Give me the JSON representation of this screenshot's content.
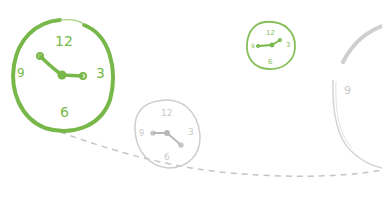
{
  "illustration": {
    "subject": "clocks-along-dashed-path",
    "colors": {
      "primary_green": "#78b84a",
      "gray": "#c8c8c8",
      "dash_gray": "#c4c4c4",
      "background": "#ffffff"
    },
    "clocks": [
      {
        "name": "large-green-clock",
        "numerals": {
          "n12": "12",
          "n3": "3",
          "n6": "6",
          "n9": "9"
        }
      },
      {
        "name": "medium-gray-clock",
        "numerals": {
          "n12": "12",
          "n3": "3",
          "n6": "6",
          "n9": "9"
        }
      },
      {
        "name": "small-green-clock",
        "numerals": {
          "n12": "12",
          "n3": "3",
          "n6": "6",
          "n9": "9"
        }
      },
      {
        "name": "partial-gray-clock",
        "numerals": {
          "n9": "9"
        }
      }
    ]
  }
}
